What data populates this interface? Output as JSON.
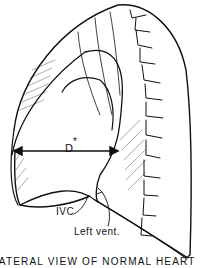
{
  "figure": {
    "caption": "LATERAL VIEW OF NORMAL HEART",
    "labels": {
      "diameter": "D",
      "diameter_marker": "*",
      "ivc": "IVC",
      "left_ventricle": "Left vent."
    },
    "colors": {
      "ink": "#111111",
      "background": "#ffffff"
    }
  }
}
